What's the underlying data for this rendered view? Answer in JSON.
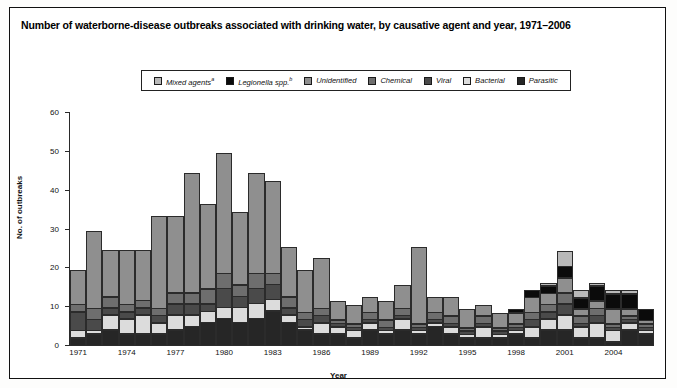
{
  "figure": {
    "title": "Number of waterborne-disease outbreaks associated with drinking water, by causative agent and year, 1971–2006"
  },
  "legend": {
    "position": "top-center",
    "items": [
      {
        "label": "Mixed agents",
        "sup": "a",
        "color": "#b9b9b9",
        "name": "mixed-agents"
      },
      {
        "label": "Legionella spp.",
        "sup": "b",
        "color": "#0b0b0b",
        "name": "legionella-spp"
      },
      {
        "label": "Unidentified",
        "sup": "",
        "color": "#8f8f8f",
        "name": "unidentified"
      },
      {
        "label": "Chemical",
        "sup": "",
        "color": "#6e6e6e",
        "name": "chemical"
      },
      {
        "label": "Viral",
        "sup": "",
        "color": "#4a4a4a",
        "name": "viral"
      },
      {
        "label": "Bacterial",
        "sup": "",
        "color": "#dcdcdc",
        "name": "bacterial"
      },
      {
        "label": "Parasitic",
        "sup": "",
        "color": "#262626",
        "name": "parasitic"
      }
    ]
  },
  "axes": {
    "y_title": "No. of outbreaks",
    "x_title": "Year",
    "y_ticks": [
      0,
      10,
      20,
      30,
      40,
      50,
      60
    ],
    "x_tick_labels": [
      "1971",
      "1974",
      "1977",
      "1980",
      "1983",
      "1986",
      "1989",
      "1992",
      "1995",
      "1998",
      "2001",
      "2004"
    ]
  },
  "chart_data": {
    "type": "bar",
    "stacked": true,
    "title": "Number of waterborne-disease outbreaks associated with drinking water, by causative agent and year, 1971–2006",
    "xlabel": "Year",
    "ylabel": "No. of outbreaks",
    "ylim": [
      0,
      60
    ],
    "grid": false,
    "legend_position": "top-center",
    "categories": [
      "1971",
      "1972",
      "1973",
      "1974",
      "1975",
      "1976",
      "1977",
      "1978",
      "1979",
      "1980",
      "1981",
      "1982",
      "1983",
      "1984",
      "1985",
      "1986",
      "1987",
      "1988",
      "1989",
      "1990",
      "1991",
      "1992",
      "1993",
      "1994",
      "1995",
      "1996",
      "1997",
      "1998",
      "1999",
      "2000",
      "2001",
      "2002",
      "2003",
      "2004",
      "2005",
      "2006"
    ],
    "series": [
      {
        "name": "Parasitic",
        "color": "#262626",
        "values": [
          2,
          3,
          4,
          3,
          3,
          3,
          4,
          5,
          6,
          7,
          6,
          7,
          9,
          6,
          4,
          3,
          3,
          2,
          4,
          3,
          4,
          3,
          5,
          3,
          2,
          2,
          2,
          3,
          2,
          4,
          4,
          2,
          2,
          1,
          4,
          3
        ]
      },
      {
        "name": "Bacterial",
        "color": "#dcdcdc",
        "values": [
          2,
          1,
          4,
          4,
          5,
          3,
          4,
          3,
          3,
          3,
          4,
          4,
          3,
          2,
          1,
          3,
          2,
          2,
          2,
          1,
          3,
          1,
          1,
          2,
          1,
          3,
          1,
          1,
          3,
          3,
          4,
          3,
          4,
          3,
          2,
          1
        ]
      },
      {
        "name": "Viral",
        "color": "#4a4a4a",
        "values": [
          5,
          3,
          2,
          2,
          2,
          2,
          3,
          3,
          2,
          5,
          3,
          4,
          4,
          2,
          2,
          2,
          1,
          1,
          1,
          1,
          1,
          1,
          1,
          1,
          1,
          1,
          1,
          1,
          2,
          2,
          3,
          1,
          2,
          1,
          1,
          1
        ]
      },
      {
        "name": "Chemical",
        "color": "#6e6e6e",
        "values": [
          2,
          3,
          3,
          2,
          2,
          2,
          3,
          3,
          4,
          4,
          3,
          4,
          3,
          3,
          2,
          2,
          1,
          1,
          2,
          2,
          2,
          1,
          2,
          2,
          1,
          2,
          1,
          1,
          2,
          2,
          3,
          2,
          2,
          1,
          1,
          1
        ]
      },
      {
        "name": "Unidentified",
        "color": "#8f8f8f",
        "values": [
          9,
          20,
          12,
          14,
          13,
          24,
          20,
          31,
          22,
          31,
          19,
          26,
          24,
          13,
          11,
          13,
          5,
          5,
          4,
          5,
          6,
          20,
          4,
          5,
          5,
          3,
          4,
          3,
          4,
          3,
          4,
          2,
          2,
          4,
          2,
          1
        ]
      },
      {
        "name": "Legionella spp.",
        "color": "#0b0b0b",
        "values": [
          0,
          0,
          0,
          0,
          0,
          0,
          0,
          0,
          0,
          0,
          0,
          0,
          0,
          0,
          0,
          0,
          0,
          0,
          0,
          0,
          0,
          0,
          0,
          0,
          0,
          0,
          0,
          1,
          2,
          2,
          3,
          3,
          4,
          4,
          4,
          3
        ]
      },
      {
        "name": "Mixed agents",
        "color": "#b9b9b9",
        "values": [
          0,
          0,
          0,
          0,
          0,
          0,
          0,
          0,
          0,
          0,
          0,
          0,
          0,
          0,
          0,
          0,
          0,
          0,
          0,
          0,
          0,
          0,
          0,
          0,
          0,
          0,
          0,
          0,
          0,
          1,
          4,
          2,
          1,
          1,
          1,
          0
        ]
      }
    ],
    "totals": [
      20,
      30,
      25,
      25,
      25,
      34,
      34,
      45,
      37,
      50,
      35,
      45,
      43,
      26,
      20,
      23,
      12,
      11,
      13,
      12,
      16,
      26,
      13,
      13,
      10,
      11,
      9,
      10,
      15,
      17,
      25,
      15,
      17,
      15,
      15,
      10
    ]
  }
}
